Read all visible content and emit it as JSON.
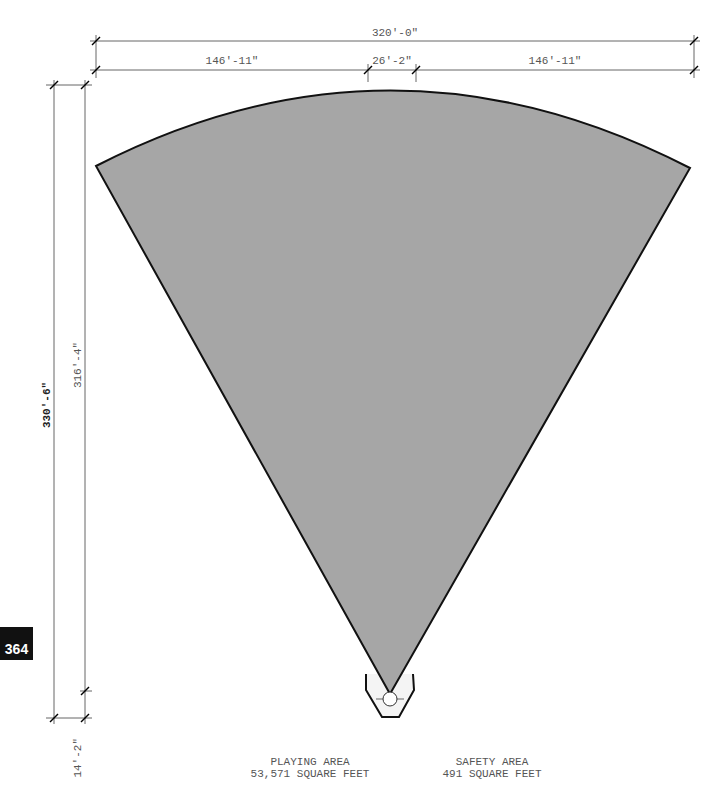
{
  "page_number": "364",
  "dimensions": {
    "overall_width": "320'-0\"",
    "left_segment": "146'-11\"",
    "center_segment": "26'-2\"",
    "right_segment": "146'-11\"",
    "overall_height": "330'-6\"",
    "field_height": "316'-4\"",
    "safety_depth": "14'-2\""
  },
  "areas": {
    "playing": {
      "title": "PLAYING AREA",
      "value": "53,571 SQUARE FEET"
    },
    "safety": {
      "title": "SAFETY AREA",
      "value": "491 SQUARE FEET"
    }
  },
  "colors": {
    "field_fill": "#a6a6a6",
    "outline": "#111111",
    "dimension_line": "#666666",
    "safety_fill": "#f4f4f4"
  }
}
